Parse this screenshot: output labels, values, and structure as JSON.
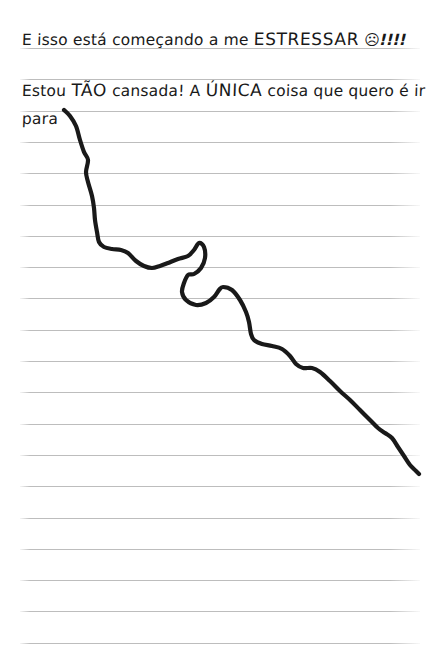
{
  "page": {
    "background_color": "#ffffff",
    "width": 440,
    "height": 669,
    "ruled_line_color": "#bdbdbd",
    "ink_color": "#191919",
    "type": "handwritten-notebook-page"
  },
  "notebook": {
    "rule_start_y": 48,
    "rule_spacing": 31.3,
    "rule_count": 20,
    "rule_left": 20,
    "rule_right": 420
  },
  "text_lines": [
    {
      "id": "line-1",
      "segments": [
        {
          "text": "E isso está começando a me ",
          "style": "normal"
        },
        {
          "text": "ESTRESSAR",
          "style": "big"
        },
        {
          "text": " ",
          "style": "normal"
        },
        {
          "text": "☹",
          "style": "emoji"
        },
        {
          "text": "!!!!",
          "style": "bangs"
        }
      ],
      "plain": "E isso está começando a me ESTRESSAR ☹!!!!"
    },
    {
      "id": "line-2",
      "segments": [
        {
          "text": "Estou ",
          "style": "normal"
        },
        {
          "text": "TÃO",
          "style": "big"
        },
        {
          "text": " cansada! A ",
          "style": "normal"
        },
        {
          "text": "ÚNICA",
          "style": "big"
        },
        {
          "text": " coisa que quero é ir",
          "style": "normal"
        }
      ],
      "plain": "Estou TÃO cansada! A ÚNICA coisa que quero é ir"
    },
    {
      "id": "line-3",
      "segments": [
        {
          "text": "para",
          "style": "normal"
        }
      ],
      "plain": "para"
    }
  ],
  "chart_data": {
    "type": "line",
    "title": "",
    "xlabel": "",
    "ylabel": "",
    "grid": true,
    "legend": null,
    "xlim": [
      62,
      420
    ],
    "ylim": [
      108,
      478
    ],
    "points": [
      [
        64,
        110
      ],
      [
        70,
        116
      ],
      [
        76,
        126
      ],
      [
        80,
        140
      ],
      [
        84,
        152
      ],
      [
        88,
        160
      ],
      [
        86,
        172
      ],
      [
        88,
        182
      ],
      [
        92,
        196
      ],
      [
        94,
        208
      ],
      [
        95,
        220
      ],
      [
        97,
        232
      ],
      [
        99,
        242
      ],
      [
        104,
        247
      ],
      [
        112,
        249
      ],
      [
        121,
        250
      ],
      [
        128,
        253
      ],
      [
        136,
        261
      ],
      [
        144,
        266
      ],
      [
        152,
        268
      ],
      [
        160,
        266
      ],
      [
        168,
        263
      ],
      [
        178,
        259
      ],
      [
        188,
        256
      ],
      [
        194,
        250
      ],
      [
        199,
        243
      ],
      [
        204,
        247
      ],
      [
        205,
        258
      ],
      [
        201,
        268
      ],
      [
        194,
        274
      ],
      [
        188,
        275
      ],
      [
        184,
        283
      ],
      [
        182,
        292
      ],
      [
        186,
        300
      ],
      [
        196,
        305
      ],
      [
        206,
        303
      ],
      [
        214,
        297
      ],
      [
        219,
        290
      ],
      [
        223,
        287
      ],
      [
        232,
        290
      ],
      [
        240,
        300
      ],
      [
        246,
        312
      ],
      [
        249,
        322
      ],
      [
        251,
        334
      ],
      [
        254,
        340
      ],
      [
        262,
        344
      ],
      [
        272,
        346
      ],
      [
        282,
        349
      ],
      [
        290,
        356
      ],
      [
        296,
        364
      ],
      [
        303,
        368
      ],
      [
        312,
        368
      ],
      [
        320,
        372
      ],
      [
        330,
        381
      ],
      [
        340,
        391
      ],
      [
        350,
        400
      ],
      [
        360,
        410
      ],
      [
        370,
        420
      ],
      [
        378,
        428
      ],
      [
        385,
        433
      ],
      [
        392,
        438
      ],
      [
        398,
        447
      ],
      [
        404,
        456
      ],
      [
        410,
        465
      ],
      [
        416,
        471
      ],
      [
        419,
        474
      ]
    ],
    "stroke_color": "#191919",
    "stroke_width": 4.2,
    "loop": {
      "center_x": 196,
      "center_y": 259,
      "rx": 9,
      "ry": 17
    }
  }
}
